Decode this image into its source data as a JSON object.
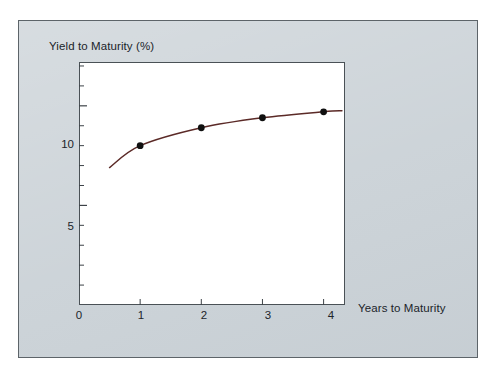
{
  "figure": {
    "panel_background": "#ccd3d8",
    "plot_background": "#ffffff",
    "border_color": "#5d6469"
  },
  "chart_data": {
    "type": "line",
    "title": "",
    "xlabel": "Years to Maturity",
    "ylabel": "Yield to Maturity (%)",
    "xlim": [
      0,
      4.35
    ],
    "ylim": [
      0,
      12.2
    ],
    "xticks": [
      0,
      1,
      2,
      3,
      4
    ],
    "xtick_labels": [
      "0",
      "1",
      "2",
      "3",
      "4"
    ],
    "yticks": [
      5,
      10
    ],
    "ytick_labels": [
      "5",
      "10"
    ],
    "y_minor_tick_interval": 1,
    "grid": false,
    "legend": null,
    "series": [
      {
        "name": "Yield curve",
        "line_color": "#5b2a27",
        "marker_color": "#101010",
        "marker": "circle",
        "x": [
          0.5,
          1,
          2,
          3,
          4,
          4.3
        ],
        "y": [
          6.9,
          8.0,
          8.9,
          9.4,
          9.7,
          9.75
        ],
        "marker_points": [
          {
            "x": 1,
            "y": 8.0
          },
          {
            "x": 2,
            "y": 8.9
          },
          {
            "x": 3,
            "y": 9.4
          },
          {
            "x": 4,
            "y": 9.7
          }
        ]
      }
    ]
  }
}
